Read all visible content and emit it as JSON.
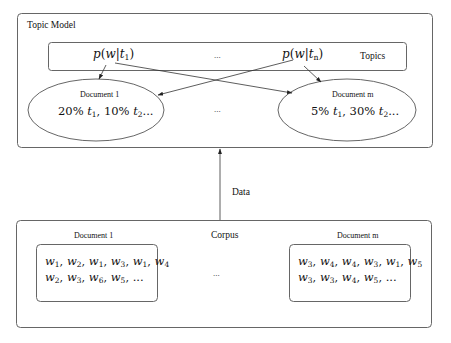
{
  "topic_model": {
    "title": "Topic Model",
    "topics_label": "Topics",
    "topic_first": {
      "prefix": "p(w|t",
      "sub": "1",
      "suffix": ")"
    },
    "topic_last": {
      "prefix": "p(w|t",
      "sub": "n",
      "suffix": ")"
    },
    "topics_ellipsis": "...",
    "documents": [
      {
        "label": "Document 1",
        "text": "20% t1, 10% t2...",
        "p1": "20% ",
        "t1": "t",
        "s1": "1",
        "p2": ", 10% ",
        "t2": "t",
        "s2": "2",
        "tail": "..."
      },
      {
        "label": "Document m",
        "text": "5% t1, 30% t2...",
        "p1": "5% ",
        "t1": "t",
        "s1": "1",
        "p2": ", 30% ",
        "t2": "t",
        "s2": "2",
        "tail": "..."
      }
    ],
    "documents_ellipsis": "..."
  },
  "data_arrow": {
    "label": "Data"
  },
  "corpus": {
    "title": "Corpus",
    "documents_ellipsis": "...",
    "documents": [
      {
        "label": "Document 1",
        "line1": "w1, w2, w1, w3, w1, w4",
        "line2": "w2, w3, w6, w5, ...",
        "l1": [
          "1",
          "2",
          "1",
          "3",
          "1",
          "4"
        ],
        "l2": [
          "2",
          "3",
          "6",
          "5"
        ]
      },
      {
        "label": "Document m",
        "line1": "w3, w4, w4, w3, w1, w5",
        "line2": "w3, w3, w4, w5, ...",
        "l1": [
          "3",
          "4",
          "4",
          "3",
          "1",
          "5"
        ],
        "l2": [
          "3",
          "3",
          "4",
          "5"
        ]
      }
    ]
  },
  "colors": {
    "stroke": "#555555",
    "text": "#111111",
    "background": "#ffffff"
  }
}
